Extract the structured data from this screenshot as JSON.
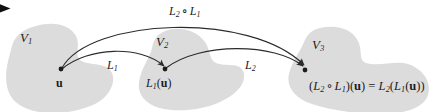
{
  "figure": {
    "background_color": "#ffffff",
    "blob_fill": "#dcdcdc",
    "stroke_color": "#2b2b2b",
    "text_color": "#1c1c1c"
  },
  "marker": {
    "name": "bullet-arrow-marker",
    "glyph": "▶"
  },
  "spaces": [
    {
      "id": "V1",
      "label_base": "V",
      "label_sub": "1",
      "x": 20,
      "y": 31
    },
    {
      "id": "V2",
      "label_base": "V",
      "label_sub": "2",
      "x": 156,
      "y": 35
    },
    {
      "id": "V3",
      "label_base": "V",
      "label_sub": "3",
      "x": 312,
      "y": 38
    }
  ],
  "points": [
    {
      "id": "u",
      "in_space": "V1",
      "dot_x": 61,
      "dot_y": 69,
      "label_x": 56,
      "label_y": 76,
      "label_html": "u"
    },
    {
      "id": "L1u",
      "in_space": "V2",
      "dot_x": 165,
      "dot_y": 69,
      "label_x": 146,
      "label_y": 76,
      "label_html": "L1(u)"
    },
    {
      "id": "L2L1u",
      "in_space": "V3",
      "dot_x": 305,
      "dot_y": 70,
      "label_x": 309,
      "label_y": 79,
      "label_html": "(L2 o L1)(u) = L2(L1(u))"
    }
  ],
  "arrows": [
    {
      "id": "L1",
      "from": "u",
      "to": "L1u",
      "label_base": "L",
      "label_sub": "1",
      "label_x": 107,
      "label_y": 59
    },
    {
      "id": "L2",
      "from": "L1u",
      "to": "L2L1u",
      "label_base": "L",
      "label_sub": "2",
      "label_x": 245,
      "label_y": 59
    },
    {
      "id": "L2_comp_L1",
      "from": "u",
      "to": "L2L1u",
      "label_base": "L",
      "label_sub": "2",
      "label_op": " ∘ ",
      "label_base2": "L",
      "label_sub2": "1",
      "label_x": 169,
      "label_y": 5
    }
  ],
  "labels": {
    "space_v1": "V",
    "space_v1_sub": "1",
    "space_v2": "V",
    "space_v2_sub": "2",
    "space_v3": "V",
    "space_v3_sub": "3",
    "point_u": "u",
    "map_l1": "L",
    "map_l1_sub": "1",
    "map_l2": "L",
    "map_l2_sub": "2",
    "comp_l2": "L",
    "comp_l2_sub": "2",
    "comp_op": "∘",
    "comp_l1": "L",
    "comp_l1_sub": "1",
    "point_l1u_fn": "L",
    "point_l1u_sub": "1",
    "point_l1u_open": "(",
    "point_l1u_arg": "u",
    "point_l1u_close": ")",
    "formula_open": "(",
    "formula_l2": "L",
    "formula_l2_sub": "2",
    "formula_circ": "∘",
    "formula_l1": "L",
    "formula_l1_sub": "1",
    "formula_close_arg": ")(",
    "formula_u1": "u",
    "formula_eq": ") = ",
    "formula_r_l2": "L",
    "formula_r_l2_sub": "2",
    "formula_r_open": "(",
    "formula_r_l1": "L",
    "formula_r_l1_sub": "1",
    "formula_r_open2": "(",
    "formula_u2": "u",
    "formula_r_close": "))"
  }
}
